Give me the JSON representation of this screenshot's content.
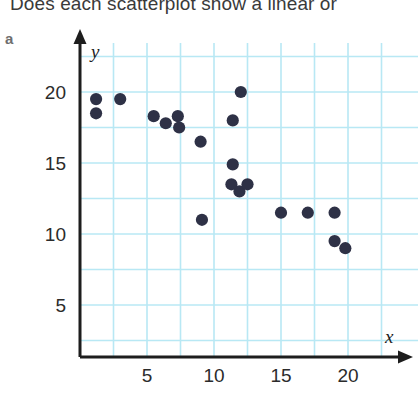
{
  "question": {
    "text": "Does each scatterplot show a linear or"
  },
  "part": {
    "label": "a"
  },
  "colors": {
    "grid": "#b8e8f4",
    "axis": "#1d1d1d",
    "point": "#2e3146",
    "text": "#3a3a3a",
    "background": "#ffffff"
  },
  "chart_data": {
    "type": "scatter",
    "title": "",
    "xlabel": "x",
    "ylabel": "y",
    "xlim": [
      0,
      23.5
    ],
    "ylim": [
      0,
      22.5
    ],
    "xticks": [
      5,
      10,
      15,
      20
    ],
    "yticks": [
      5,
      10,
      15,
      20
    ],
    "grid": true,
    "legend": null,
    "relationship": "negative linear",
    "series": [
      {
        "name": "data",
        "points": [
          [
            1.2,
            19.5
          ],
          [
            1.2,
            18.5
          ],
          [
            3.0,
            19.5
          ],
          [
            5.5,
            18.3
          ],
          [
            6.4,
            17.8
          ],
          [
            7.3,
            18.3
          ],
          [
            7.4,
            17.5
          ],
          [
            9.0,
            16.5
          ],
          [
            9.1,
            11.0
          ],
          [
            11.4,
            18.0
          ],
          [
            11.4,
            14.9
          ],
          [
            11.3,
            13.5
          ],
          [
            11.9,
            13.0
          ],
          [
            12.0,
            20.0
          ],
          [
            12.5,
            13.5
          ],
          [
            15.0,
            11.5
          ],
          [
            17.0,
            11.5
          ],
          [
            19.0,
            11.5
          ],
          [
            19.0,
            9.5
          ],
          [
            19.8,
            9.0
          ]
        ]
      }
    ]
  }
}
